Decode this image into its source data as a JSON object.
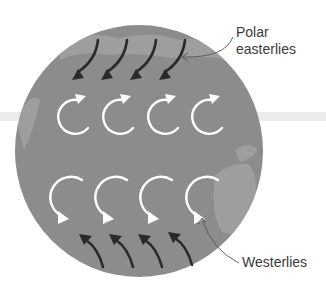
{
  "diagram": {
    "title": "",
    "labels": {
      "polar_line1": "Polar",
      "polar_line2": "easterlies",
      "westerlies": "Westerlies"
    },
    "colors": {
      "globe": "#8c8c8c",
      "land": "#a3a3a3",
      "band": "#ebebeb",
      "circulation_arrows": "#ffffff",
      "wind_arrows": "#2a2a2a",
      "text": "#3a3a3a",
      "leader": "#555555"
    },
    "elements": {
      "polar_easterly_arrows": 4,
      "upper_circulation_arrows": 4,
      "lower_circulation_arrows": 4,
      "westerly_wind_arrows": 4
    }
  }
}
